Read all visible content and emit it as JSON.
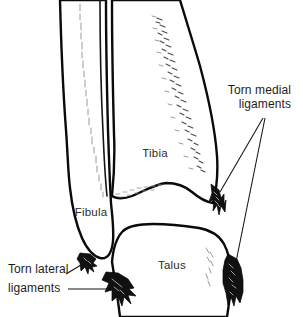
{
  "figure": {
    "kind": "anatomical-illustration",
    "background_color": "#ffffff",
    "line_color": "#111111",
    "label_color": "#2b2b2b"
  },
  "bone_labels": [
    {
      "id": "tibia",
      "text": "Tibia",
      "x": 155,
      "y": 157
    },
    {
      "id": "fibula",
      "text": "Fibula",
      "x": 91,
      "y": 216
    },
    {
      "id": "talus",
      "text": "Talus",
      "x": 172,
      "y": 269
    }
  ],
  "callouts": [
    {
      "id": "torn-medial-ligaments",
      "line1": "Torn medial",
      "line2": "ligaments",
      "align": "right",
      "x": 291,
      "y1": 94,
      "y2": 108,
      "leader_targets": [
        "medial-malleolus-stump",
        "deltoid-stump"
      ]
    },
    {
      "id": "torn-lateral-ligaments",
      "line1": "Torn lateral",
      "line2": "ligaments",
      "align": "left",
      "x": 8,
      "y1": 273,
      "y2": 292,
      "leader_targets": [
        "fibular-tip-stump",
        "calcaneofibular-stump"
      ]
    }
  ],
  "ligament_stumps": [
    {
      "id": "medial-malleolus-stump",
      "side": "medial",
      "color": "#111111"
    },
    {
      "id": "deltoid-stump",
      "side": "medial",
      "color": "#111111"
    },
    {
      "id": "fibular-tip-stump",
      "side": "lateral",
      "color": "#111111"
    },
    {
      "id": "calcaneofibular-stump",
      "side": "lateral",
      "color": "#111111"
    }
  ]
}
